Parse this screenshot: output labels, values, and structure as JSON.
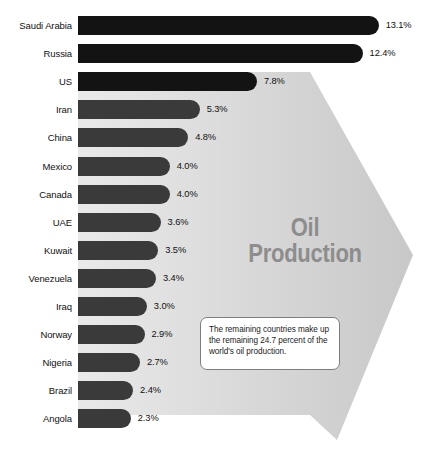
{
  "chart_data": {
    "type": "bar",
    "title": "Oil Production",
    "title_lines": [
      "Oil",
      "Production"
    ],
    "orientation": "horizontal",
    "xlabel": "",
    "ylabel": "",
    "unit": "%",
    "categories": [
      "Saudi Arabia",
      "Russia",
      "US",
      "Iran",
      "China",
      "Mexico",
      "Canada",
      "UAE",
      "Kuwait",
      "Venezuela",
      "Iraq",
      "Norway",
      "Nigeria",
      "Brazil",
      "Angola"
    ],
    "values": [
      13.1,
      12.4,
      7.8,
      5.3,
      4.8,
      4.0,
      4.0,
      3.6,
      3.5,
      3.4,
      3.0,
      2.9,
      2.7,
      2.4,
      2.3
    ],
    "value_labels": [
      "13.1%",
      "12.4%",
      "7.8%",
      "5.3%",
      "4.8%",
      "4.0%",
      "4.0%",
      "3.6%",
      "3.5%",
      "3.4%",
      "3.0%",
      "2.9%",
      "2.7%",
      "2.4%",
      "2.3%"
    ],
    "xlim": [
      0,
      13.1
    ],
    "grid": false,
    "legend": false,
    "annotation": "The remaining countries make up the remaining 24.7 percent of the world's oil production."
  },
  "callout": {
    "text": "The remaining countries make up the remaining 24.7 percent of the world's oil production."
  },
  "colors": {
    "bar_dark": "#131313",
    "bar": "#3a3a3a",
    "arrow_fill": "#cfcfcf",
    "title_text": "#8d8d8d",
    "label_text": "#111111",
    "background": "#ffffff"
  }
}
